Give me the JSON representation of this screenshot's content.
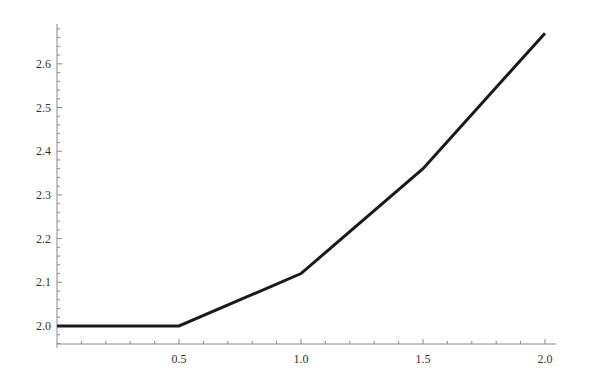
{
  "chart_data": {
    "type": "line",
    "title": "",
    "xlabel": "",
    "ylabel": "",
    "x": [
      0,
      0.5,
      1.0,
      1.5,
      2.0
    ],
    "series": [
      {
        "name": "",
        "values": [
          2.0,
          2.0,
          2.12,
          2.36,
          2.67
        ],
        "color": "#1a1a1a"
      }
    ],
    "xlim": [
      0,
      2.04
    ],
    "ylim": [
      1.96,
      2.69
    ],
    "x_ticks": [
      0.5,
      1.0,
      1.5,
      2.0
    ],
    "x_tick_labels": [
      "0.5",
      "1.0",
      "1.5",
      "2.0"
    ],
    "y_ticks": [
      2.0,
      2.1,
      2.2,
      2.3,
      2.4,
      2.5,
      2.6
    ],
    "y_tick_labels": [
      "2.0",
      "2.1",
      "2.2",
      "2.3",
      "2.4",
      "2.5",
      "2.6"
    ],
    "grid": false,
    "legend": "none"
  }
}
